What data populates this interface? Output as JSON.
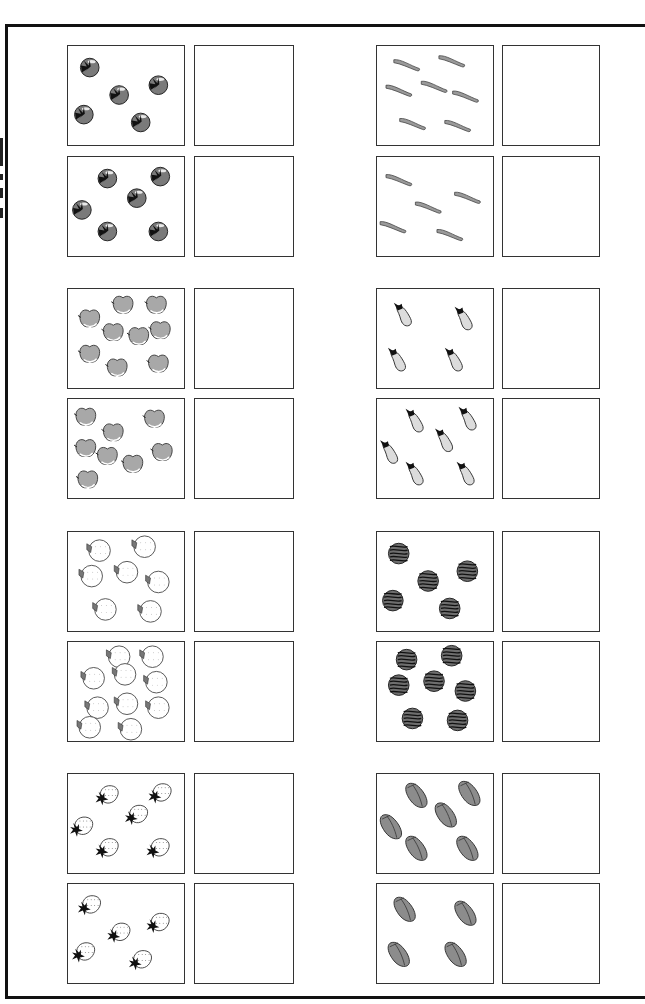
{
  "worksheet": {
    "type": "counting-worksheet",
    "instructions_visible": false,
    "rows": [
      {
        "group": 1,
        "left": {
          "item": "tomato",
          "counts": [
            5,
            6
          ]
        },
        "right": {
          "item": "bean-pod",
          "counts": [
            7,
            5
          ]
        }
      },
      {
        "group": 2,
        "left": {
          "item": "apple",
          "counts": [
            9,
            8
          ]
        },
        "right": {
          "item": "eggplant",
          "counts": [
            4,
            6
          ]
        }
      },
      {
        "group": 3,
        "left": {
          "item": "orange",
          "counts": [
            7,
            10
          ]
        },
        "right": {
          "item": "watermelon",
          "counts": [
            5,
            7
          ]
        }
      },
      {
        "group": 4,
        "left": {
          "item": "strawberry",
          "counts": [
            6,
            5
          ]
        },
        "right": {
          "item": "pepper",
          "counts": [
            6,
            4
          ]
        }
      }
    ],
    "answer_boxes": "empty",
    "colors": {
      "border": "#111111",
      "tomato": "#7a7a7a",
      "apple": "#a8a8a8",
      "eggplant": "#dcdcdc",
      "watermelon": "#6e6e6e",
      "pepper": "#8c8c8c",
      "bean": "#9a9a9a"
    }
  }
}
